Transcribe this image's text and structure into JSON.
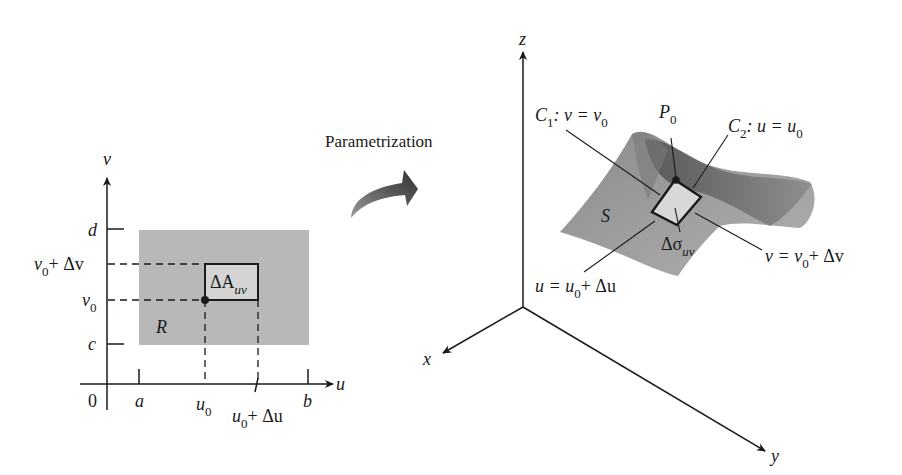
{
  "colors": {
    "region_fill": "#b8b8b8",
    "patch_fill": "#d4d4d4",
    "surface_light": "#a9a9a9",
    "surface_dark": "#6e6e6e",
    "ink": "#1a1a1a"
  },
  "left_panel": {
    "axis_v_label": "v",
    "axis_u_label": "u",
    "origin_label": "0",
    "tick_a": "a",
    "tick_b": "b",
    "tick_c": "c",
    "tick_d": "d",
    "u0_main": "u",
    "u0_sub": "0",
    "u0du_main": "u",
    "u0du_sub": "0",
    "u0du_rest": "+ Δu",
    "v0_main": "v",
    "v0_sub": "0",
    "v0dv_main": "v",
    "v0dv_sub": "0",
    "v0dv_rest": "+ Δv",
    "region_label": "R",
    "patch_label_main": "ΔA",
    "patch_label_sub": "uv"
  },
  "arrow": {
    "title": "Parametrization"
  },
  "right_panel": {
    "axis_x_label": "x",
    "axis_y_label": "y",
    "axis_z_label": "z",
    "surface_label": "S",
    "c1_main": "C",
    "c1_sub": "1",
    "c1_rest": ": v = v",
    "c1_rest_sub": "0",
    "c2_main": "C",
    "c2_sub": "2",
    "c2_rest": ": u = u",
    "c2_rest_sub": "0",
    "p0_main": "P",
    "p0_sub": "0",
    "sigma_main": "Δσ",
    "sigma_sub": "uv",
    "vline_main": "v = v",
    "vline_sub": "0",
    "vline_rest": "+ Δv",
    "uline_main": "u = u",
    "uline_sub": "0",
    "uline_rest": "+ Δu"
  }
}
